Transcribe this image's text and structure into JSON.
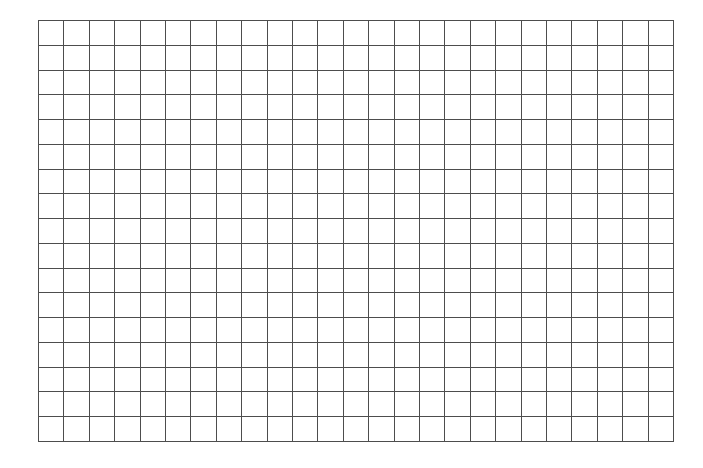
{
  "grid": {
    "columns": 25,
    "rows": 17,
    "line_color": "#4d4d4d",
    "background": "#ffffff"
  }
}
